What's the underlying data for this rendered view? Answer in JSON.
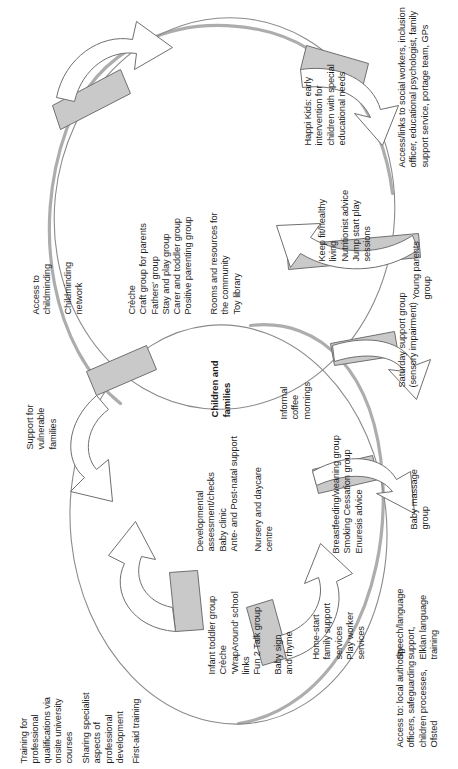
{
  "diagram": {
    "type": "cycle-venn",
    "center_label": "Children and\nfamilies",
    "orientation": "rotated-90-ccw",
    "colors": {
      "outline": "#8b8b8b",
      "shadow": "#a9a9a9",
      "arrow_band": "#c9c9c9",
      "text": "#1c1c1c",
      "background": "#ffffff"
    },
    "labels": [
      {
        "id": "training-professional-qualifications",
        "text": "Training for\nprofessional\nqualifications via\nonsite university\ncourses"
      },
      {
        "id": "sharing-specialist-aspects",
        "text": "Sharing specialist\naspects of\nprofessional\ndevelopment"
      },
      {
        "id": "first-aid-training",
        "text": "First-aid training"
      },
      {
        "id": "support-vulnerable-families",
        "text": "Support for\nvulnerable\nfamilies"
      },
      {
        "id": "access-to-childminding",
        "text": "Access to\nchildminding"
      },
      {
        "id": "childminding-network",
        "text": "Childminding\nnetwork"
      },
      {
        "id": "creche-craft-fathers-stay-carer-positive",
        "text": "Crèche\nCraft group for parents\nFathers' group\nStay and play group\nCarer and toddler group\nPositive parenting group"
      },
      {
        "id": "rooms-resources-toy-library",
        "text": "Rooms and resources for\nthe community\nToy library"
      },
      {
        "id": "informal-coffee-mornings",
        "text": "Informal\ncoffee\nmornings"
      },
      {
        "id": "infant-toddler-creche-wraparound-fun2talk",
        "text": "Infant toddler group\nCrèche\n'WrapAround' school\nlinks\nFun 2 Talk group"
      },
      {
        "id": "baby-sign-and-rhyme",
        "text": "Baby sign\nand rhyme"
      },
      {
        "id": "developmental-assessment-baby-clinic-antenatal",
        "text": "Developmental\nassessment/checks\nBaby clinic\nAnte- and Post-natal support"
      },
      {
        "id": "nursery-and-daycare-centre",
        "text": "Nursery and daycare\ncentre"
      },
      {
        "id": "home-start-family-support-play-worker",
        "text": "Home-start\nfamily support\nservices\nPlay worker\nservices"
      },
      {
        "id": "breastfeeding-smoking-enuresis",
        "text": "Breastfeeding/weaning group\nSmoking Cessation group\nEnuresis advice"
      },
      {
        "id": "keep-fit-nutritionist-jump-start",
        "text": "Keep fit/healthy\nliving\nNutritionist advice\nJump start play\nsessions"
      },
      {
        "id": "happi-kids-early-intervention",
        "text": "Happi Kids: early\nintervention for\nchildren with special\neducational needs"
      },
      {
        "id": "access-local-authority-safeguarding-ofsted",
        "text": "Access to: local authority\nofficers, safeguarding\nchildren processes,\nOfsted"
      },
      {
        "id": "speech-language-elklan",
        "text": "Speech/language\nsupport,\nElklan language\ntraining"
      },
      {
        "id": "baby-massage-group",
        "text": "Baby massage\ngroup"
      },
      {
        "id": "saturday-support-group",
        "text": "Saturday support group\n(sensory impairment)"
      },
      {
        "id": "young-parents-group",
        "text": "Young parents\ngroup"
      },
      {
        "id": "access-links-social-workers-portage-gps",
        "text": "Access/links to social workers, inclusion\nofficer, educational psychologist, family\nsupport service, portage team, GPs"
      }
    ]
  }
}
